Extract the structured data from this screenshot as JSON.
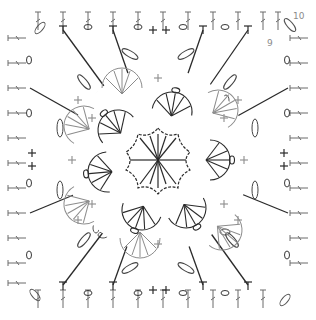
{
  "diagram": {
    "type": "crochet-chart",
    "colors": {
      "background": "#ffffff",
      "dark_stitch": "#2a2a2a",
      "light_stitch": "#8c8c8c"
    },
    "round_labels": [
      {
        "text": "10",
        "position": "top-right corner, outer round"
      },
      {
        "text": "9",
        "position": "top-right corner, inner round"
      }
    ],
    "regions": [
      {
        "name": "center-star",
        "description": "6-point chain star outline with clustered tall stitches radiating from center"
      },
      {
        "name": "fan-ring-dark",
        "count": 6,
        "description": "dark fan/shell clusters around center star"
      },
      {
        "name": "fan-ring-light",
        "count": 6,
        "description": "light grey fan/shell clusters between dark fans"
      },
      {
        "name": "chain-loop-ring",
        "description": "chain loops joining fans forming an octagon ring"
      },
      {
        "name": "radiating-stitches",
        "description": "long trebles and single crochet crosses radiating to square edges"
      },
      {
        "name": "border-rows",
        "description": "two outer border rounds of post stitches with chain spaces along all four edges"
      }
    ],
    "edge_pattern": {
      "top": [
        "T",
        "o",
        "T",
        "o",
        "+",
        "+",
        "o",
        "T",
        "o",
        "T"
      ],
      "left": [
        "o",
        "T",
        "o",
        "+",
        "+",
        "o",
        "T",
        "o"
      ],
      "right": [
        "o",
        "T",
        "o",
        "+",
        "+",
        "o",
        "T",
        "o"
      ],
      "bottom": [
        "T",
        "o",
        "T",
        "o",
        "+",
        "+",
        "o",
        "T",
        "o",
        "T"
      ]
    }
  }
}
